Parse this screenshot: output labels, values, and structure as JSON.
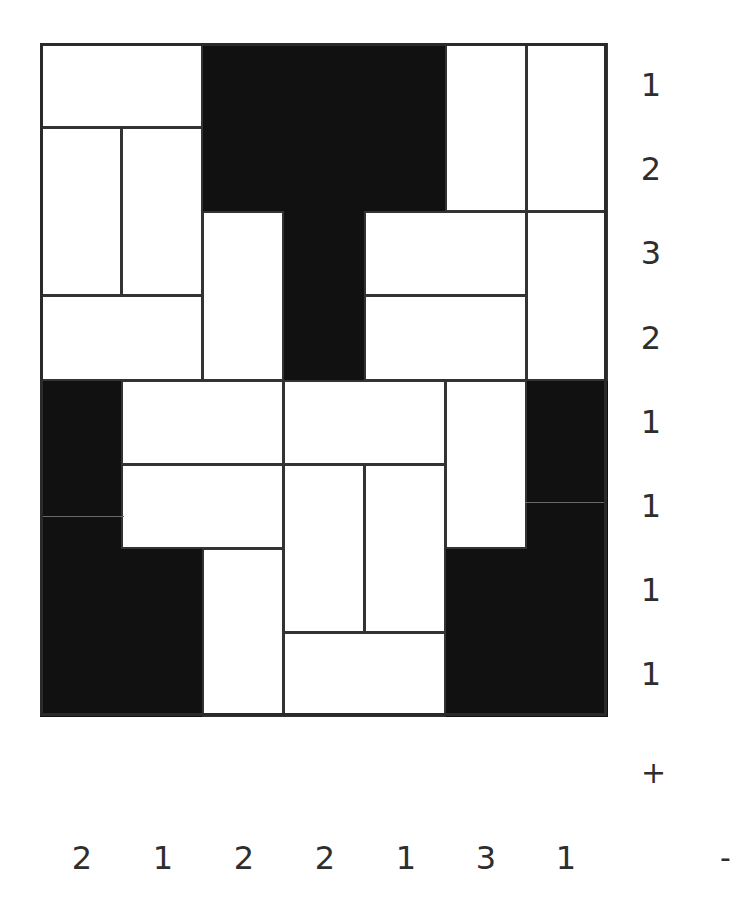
{
  "puzzle": {
    "cols": 7,
    "rows": 8,
    "row_clues": [
      "1",
      "2",
      "3",
      "2",
      "1",
      "1",
      "1",
      "1"
    ],
    "col_clues": [
      "2",
      "1",
      "2",
      "2",
      "1",
      "3",
      "1"
    ],
    "controls": {
      "plus_label": "+",
      "minus_label": "-"
    },
    "colors": {
      "black_cell": "#111111",
      "white_cell": "#ffffff",
      "line": "#333333"
    },
    "black_cells": [
      [
        0,
        2
      ],
      [
        0,
        3
      ],
      [
        0,
        4
      ],
      [
        1,
        2
      ],
      [
        1,
        3
      ],
      [
        1,
        4
      ],
      [
        2,
        3
      ],
      [
        3,
        3
      ],
      [
        4,
        0
      ],
      [
        4,
        6
      ],
      [
        5,
        0
      ],
      [
        5,
        6
      ],
      [
        6,
        0
      ],
      [
        6,
        1
      ],
      [
        6,
        5
      ],
      [
        6,
        6
      ],
      [
        7,
        0
      ],
      [
        7,
        1
      ],
      [
        7,
        5
      ],
      [
        7,
        6
      ]
    ],
    "dominoes": [
      {
        "r": 0,
        "c": 0,
        "w": 2,
        "h": 1
      },
      {
        "r": 0,
        "c": 5,
        "w": 1,
        "h": 2
      },
      {
        "r": 0,
        "c": 6,
        "w": 1,
        "h": 2
      },
      {
        "r": 1,
        "c": 0,
        "w": 1,
        "h": 2
      },
      {
        "r": 1,
        "c": 1,
        "w": 1,
        "h": 2
      },
      {
        "r": 2,
        "c": 2,
        "w": 1,
        "h": 2
      },
      {
        "r": 2,
        "c": 4,
        "w": 2,
        "h": 1
      },
      {
        "r": 2,
        "c": 6,
        "w": 1,
        "h": 2
      },
      {
        "r": 3,
        "c": 0,
        "w": 2,
        "h": 1
      },
      {
        "r": 3,
        "c": 4,
        "w": 2,
        "h": 1
      },
      {
        "r": 4,
        "c": 1,
        "w": 2,
        "h": 1
      },
      {
        "r": 4,
        "c": 3,
        "w": 2,
        "h": 1
      },
      {
        "r": 4,
        "c": 5,
        "w": 1,
        "h": 2
      },
      {
        "r": 5,
        "c": 1,
        "w": 2,
        "h": 1
      },
      {
        "r": 5,
        "c": 3,
        "w": 1,
        "h": 2
      },
      {
        "r": 5,
        "c": 4,
        "w": 1,
        "h": 2
      },
      {
        "r": 6,
        "c": 2,
        "w": 1,
        "h": 2
      },
      {
        "r": 7,
        "c": 3,
        "w": 2,
        "h": 1
      }
    ]
  }
}
